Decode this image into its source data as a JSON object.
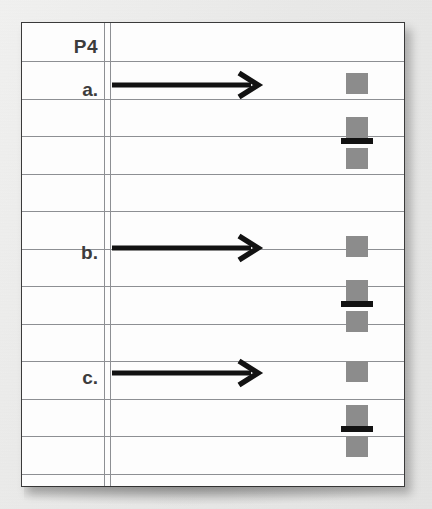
{
  "page": {
    "header_label": "P4",
    "background_color": "#ececeb",
    "paper_color": "#fdfdfd",
    "rule_color": "#8d8f93",
    "ink_color": "#121212",
    "square_color": "#8c8c8c",
    "ruled_line_count": 12
  },
  "margin": {
    "line_1_x": 82,
    "line_2_x": 88
  },
  "rules": [
    {
      "y": 38
    },
    {
      "y": 75.5
    },
    {
      "y": 113
    },
    {
      "y": 150.5
    },
    {
      "y": 188
    },
    {
      "y": 225.5
    },
    {
      "y": 263
    },
    {
      "y": 300.5
    },
    {
      "y": 338
    },
    {
      "y": 375.5
    },
    {
      "y": 413
    },
    {
      "y": 450.5
    }
  ],
  "items": [
    {
      "label": "a.",
      "label_y": 57,
      "arrow_y": 62,
      "arrow": {
        "name": "right-arrow",
        "direction": "right",
        "length": 152
      },
      "stack": {
        "top_y": 113,
        "squares_offsets": [
          -63,
          -19,
          12
        ],
        "bar_offset": 2
      }
    },
    {
      "label": "b.",
      "label_y": 220,
      "arrow_y": 225,
      "arrow": {
        "name": "right-arrow",
        "direction": "right",
        "length": 152
      },
      "stack": {
        "top_y": 276,
        "squares_offsets": [
          -63,
          -19,
          12
        ],
        "bar_offset": 2
      }
    },
    {
      "label": "c.",
      "label_y": 345,
      "arrow_y": 350,
      "arrow": {
        "name": "right-arrow",
        "direction": "right",
        "length": 152
      },
      "stack": {
        "top_y": 401,
        "squares_offsets": [
          -63,
          -19,
          12
        ],
        "bar_offset": 2
      }
    }
  ]
}
